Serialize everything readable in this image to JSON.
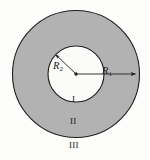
{
  "figure": {
    "background_color": "#fdfdfb",
    "annulus_fill_color": "#b2b2b2",
    "inner_disk_fill_color": "#fbfbf9",
    "stroke_color": "#231f20",
    "labels": {
      "outer_radius": "R",
      "outer_radius_subscript": "1",
      "inner_radius": "R",
      "inner_radius_subscript": "2",
      "region_inner": "I",
      "region_annulus": "II",
      "region_outer": "III"
    },
    "geometry": {
      "center_x": 76,
      "center_y": 74,
      "outer_radius_px": 64,
      "inner_radius_px": 28
    }
  }
}
